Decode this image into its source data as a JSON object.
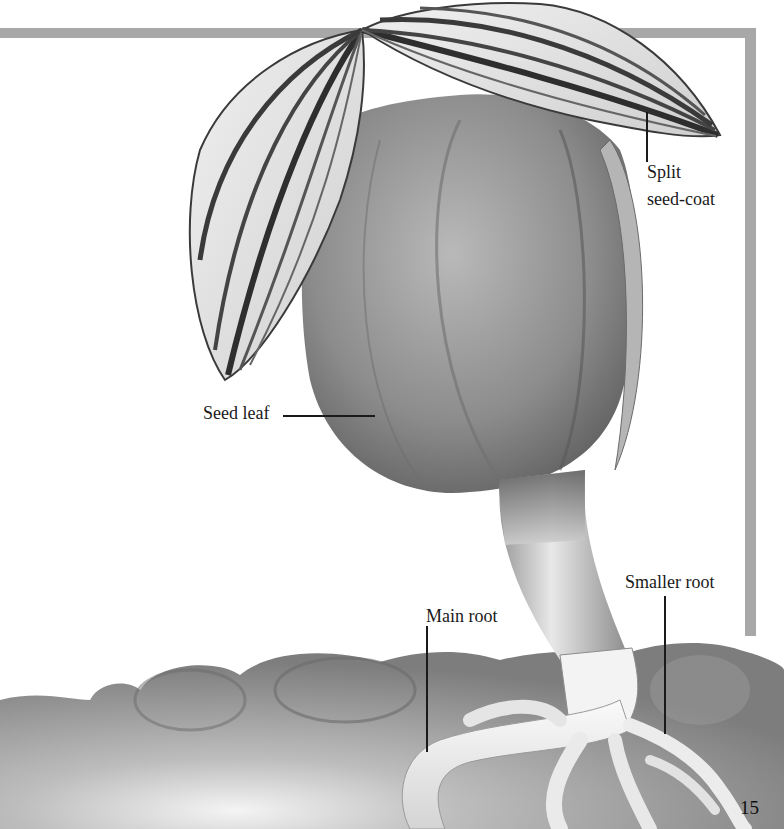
{
  "page": {
    "page_number": "15",
    "frame_color": "#a8a8a8"
  },
  "illustration": {
    "subject": "germinating seed",
    "labels": {
      "split_seed_coat_line1": "Split",
      "split_seed_coat_line2": "seed-coat",
      "seed_leaf": "Seed leaf",
      "smaller_root": "Smaller root",
      "main_root": "Main root"
    }
  }
}
